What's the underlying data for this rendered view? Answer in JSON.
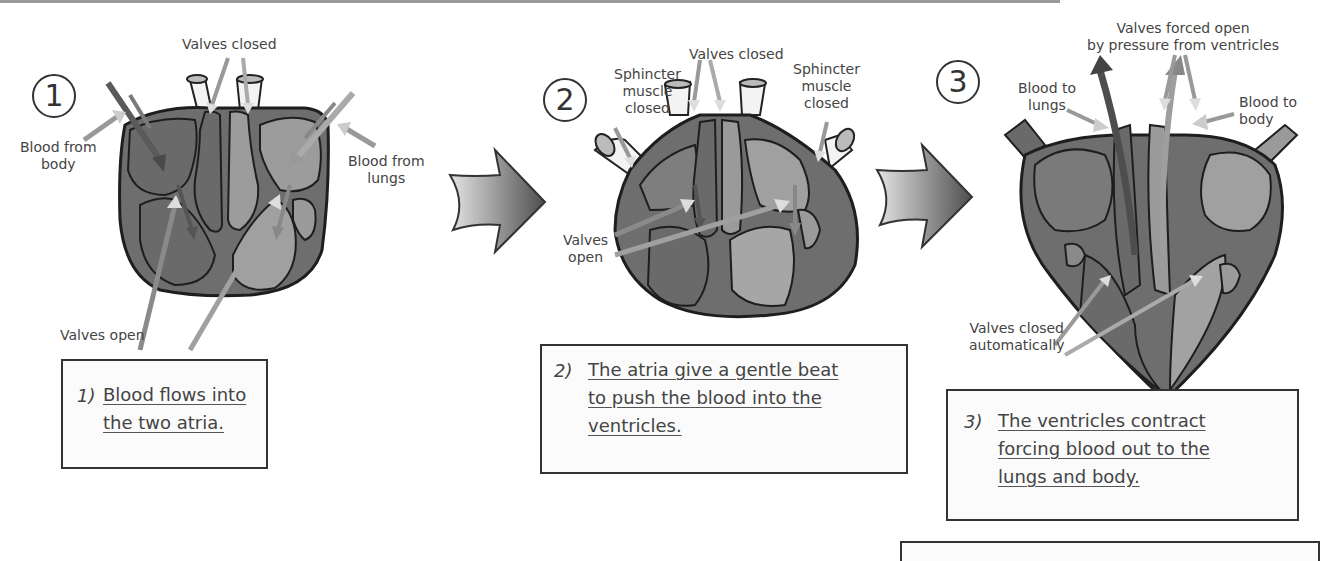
{
  "stages": [
    {
      "number": "1",
      "labels": {
        "valves_closed": "Valves closed",
        "blood_from_body_1": "Blood from",
        "blood_from_body_2": "body",
        "blood_from_lungs_1": "Blood from",
        "blood_from_lungs_2": "lungs",
        "valves_open": "Valves open"
      },
      "caption_number": "1)",
      "caption_lines": [
        "Blood flows into",
        "the two atria."
      ]
    },
    {
      "number": "2",
      "labels": {
        "valves_closed": "Valves closed",
        "sphincter_left_1": "Sphincter",
        "sphincter_left_2": "muscle",
        "sphincter_left_3": "closed",
        "sphincter_right_1": "Sphincter",
        "sphincter_right_2": "muscle",
        "sphincter_right_3": "closed",
        "valves_open_1": "Valves",
        "valves_open_2": "open"
      },
      "caption_number": "2)",
      "caption_lines": [
        "The atria give a gentle beat",
        "to push the blood into the",
        "ventricles."
      ]
    },
    {
      "number": "3",
      "labels": {
        "valves_forced_1": "Valves forced open",
        "valves_forced_2": "by pressure from ventricles",
        "blood_to_lungs_1": "Blood to",
        "blood_to_lungs_2": "lungs",
        "blood_to_body_1": "Blood to",
        "blood_to_body_2": "body",
        "valves_closed_auto_1": "Valves closed",
        "valves_closed_auto_2": "automatically"
      },
      "caption_number": "3)",
      "caption_lines": [
        "The ventricles contract",
        "forcing blood out to the",
        "lungs and body."
      ]
    }
  ],
  "colors": {
    "heart_outer": "#6e6e6e",
    "heart_dark": "#5a5a5a",
    "heart_light": "#9c9c9c",
    "outline": "#1e1e1e",
    "arrow_dark": "#4a4a4a",
    "arrow_light": "#c8c8c8"
  }
}
